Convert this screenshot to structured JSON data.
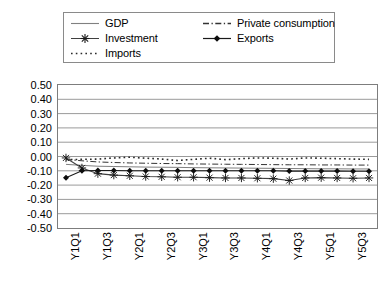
{
  "chart_data": {
    "type": "line",
    "title": "",
    "subtitle": "",
    "xlabel": "",
    "ylabel": "",
    "ylim": [
      -0.5,
      0.5
    ],
    "ytick_step": 0.1,
    "yticks": [
      "0.50",
      "0.40",
      "0.30",
      "0.20",
      "0.10",
      "0.00",
      "-0.10",
      "-0.20",
      "-0.30",
      "-0.40",
      "-0.50"
    ],
    "ytick_values": [
      0.5,
      0.4,
      0.3,
      0.2,
      0.1,
      0.0,
      -0.1,
      -0.2,
      -0.3,
      -0.4,
      -0.5
    ],
    "grid": true,
    "grid_axis": "y",
    "legend_position": "top",
    "x": [
      "Y1Q1",
      "Y1Q2",
      "Y1Q3",
      "Y1Q4",
      "Y2Q1",
      "Y2Q2",
      "Y2Q3",
      "Y2Q4",
      "Y3Q1",
      "Y3Q2",
      "Y3Q3",
      "Y3Q4",
      "Y4Q1",
      "Y4Q2",
      "Y4Q3",
      "Y4Q4",
      "Y5Q1",
      "Y5Q2",
      "Y5Q3",
      "Y5Q4"
    ],
    "xtick_labels": [
      "Y1Q1",
      "Y1Q3",
      "Y2Q1",
      "Y2Q3",
      "Y3Q1",
      "Y3Q3",
      "Y4Q1",
      "Y4Q3",
      "Y5Q1",
      "Y5Q3"
    ],
    "xtick_label_rotation": 90,
    "xtick_label_interval": 2,
    "series": [
      {
        "name": "GDP",
        "style": "solid",
        "marker": "none",
        "color": "#808080",
        "values": [
          -0.055,
          -0.062,
          -0.068,
          -0.07,
          -0.072,
          -0.074,
          -0.075,
          -0.076,
          -0.078,
          -0.079,
          -0.08,
          -0.081,
          -0.082,
          -0.083,
          -0.084,
          -0.085,
          -0.086,
          -0.086,
          -0.087,
          -0.087
        ]
      },
      {
        "name": "Private consumption",
        "style": "dash-dot",
        "marker": "none",
        "color": "#333333",
        "values": [
          -0.02,
          -0.03,
          -0.038,
          -0.042,
          -0.045,
          -0.047,
          -0.049,
          -0.05,
          -0.052,
          -0.053,
          -0.054,
          -0.055,
          -0.056,
          -0.057,
          -0.058,
          -0.058,
          -0.059,
          -0.059,
          -0.06,
          -0.06
        ]
      },
      {
        "name": "Investment",
        "style": "solid",
        "marker": "asterisk",
        "color": "#404040",
        "values": [
          -0.01,
          -0.08,
          -0.12,
          -0.13,
          -0.135,
          -0.14,
          -0.142,
          -0.145,
          -0.145,
          -0.148,
          -0.15,
          -0.15,
          -0.152,
          -0.155,
          -0.168,
          -0.15,
          -0.148,
          -0.15,
          -0.152,
          -0.15
        ]
      },
      {
        "name": "Exports",
        "style": "solid",
        "marker": "diamond",
        "color": "#1a1a1a",
        "values": [
          -0.148,
          -0.1,
          -0.098,
          -0.098,
          -0.1,
          -0.1,
          -0.1,
          -0.1,
          -0.1,
          -0.1,
          -0.1,
          -0.1,
          -0.1,
          -0.1,
          -0.102,
          -0.102,
          -0.102,
          -0.102,
          -0.103,
          -0.103
        ]
      },
      {
        "name": "Imports",
        "style": "dotted",
        "marker": "none",
        "color": "#2b2b2b",
        "values": [
          -0.022,
          -0.02,
          -0.018,
          -0.01,
          -0.005,
          -0.012,
          -0.018,
          -0.028,
          -0.02,
          -0.012,
          -0.022,
          -0.015,
          -0.01,
          -0.012,
          -0.018,
          -0.01,
          -0.012,
          -0.015,
          -0.018,
          -0.02
        ]
      }
    ]
  },
  "legend": {
    "entries": [
      {
        "label": "GDP",
        "sample": "solid-line-sample",
        "column": 1
      },
      {
        "label": "Investment",
        "sample": "asterisk-marker-line-sample",
        "column": 1
      },
      {
        "label": "Imports",
        "sample": "dotted-line-sample",
        "column": 1
      },
      {
        "label": "Private consumption",
        "sample": "dash-dot-line-sample",
        "column": 2
      },
      {
        "label": "Exports",
        "sample": "diamond-marker-line-sample",
        "column": 2
      }
    ]
  }
}
